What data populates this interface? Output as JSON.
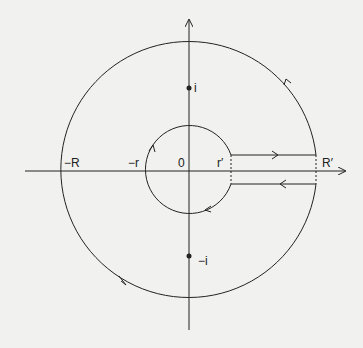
{
  "diagram": {
    "type": "keyhole-contour",
    "labels": {
      "neg_R": "−R",
      "neg_r": "−r",
      "origin": "0",
      "r_prime": "r′",
      "R_prime": "R′",
      "i": "i",
      "neg_i": "−i"
    },
    "colors": {
      "background": "#f1f1ef",
      "stroke": "#222222"
    }
  }
}
